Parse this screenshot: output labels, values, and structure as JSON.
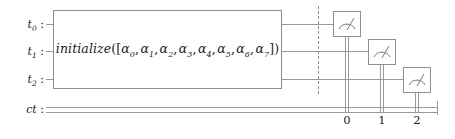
{
  "diagram": {
    "type": "quantum-circuit",
    "title": "",
    "colors": {
      "wire": "#9a9a9a",
      "box_border": "#8e8e8e",
      "text": "#1a1a1a",
      "background": "#ffffff"
    }
  },
  "quantum_wires": [
    {
      "name": "t0",
      "label_main": "t",
      "label_sub": "0",
      "separator": ":"
    },
    {
      "name": "t1",
      "label_main": "t",
      "label_sub": "1",
      "separator": ":"
    },
    {
      "name": "t2",
      "label_main": "t",
      "label_sub": "2",
      "separator": ":"
    }
  ],
  "classical_register": {
    "name": "ct",
    "label_main": "ct",
    "separator": ":",
    "bit_labels": [
      "0",
      "1",
      "2"
    ]
  },
  "gates": {
    "initialize": {
      "name": "initialize",
      "function_name": "initialize",
      "open": "([",
      "close": "])",
      "separator": ", ",
      "amplitude_symbol": "α",
      "amplitudes": [
        "0",
        "1",
        "2",
        "3",
        "4",
        "5",
        "6",
        "7"
      ],
      "full_text": "initialize([α0, α1, α2, α3, α4, α5, α6, α7])",
      "spans_wires": [
        "t0",
        "t1",
        "t2"
      ]
    },
    "barrier": {
      "name": "barrier",
      "style": "dashed"
    },
    "measurements": [
      {
        "name": "measure-t0",
        "source_wire": "t0",
        "target_bit": "0",
        "icon": "meter-icon"
      },
      {
        "name": "measure-t1",
        "source_wire": "t1",
        "target_bit": "1",
        "icon": "meter-icon"
      },
      {
        "name": "measure-t2",
        "source_wire": "t2",
        "target_bit": "2",
        "icon": "meter-icon"
      }
    ]
  }
}
